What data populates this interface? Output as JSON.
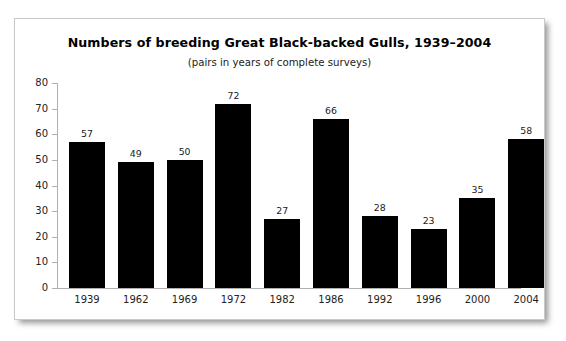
{
  "chart_data": {
    "type": "bar",
    "title": "Numbers of breeding Great Black-backed Gulls, 1939–2004",
    "subtitle": "(pairs in years of complete surveys)",
    "xlabel": "",
    "ylabel": "",
    "categories": [
      "1939",
      "1962",
      "1969",
      "1972",
      "1982",
      "1986",
      "1992",
      "1996",
      "2000",
      "2004"
    ],
    "values": [
      57,
      49,
      50,
      72,
      27,
      66,
      28,
      23,
      35,
      58
    ],
    "ylim": [
      0,
      80
    ],
    "yticks": [
      0,
      10,
      20,
      30,
      40,
      50,
      60,
      70,
      80
    ],
    "ytick_labels": [
      "0",
      "10",
      "20",
      "30",
      "40",
      "50",
      "60",
      "70",
      "80"
    ],
    "grid": false,
    "legend": false,
    "legend_position": "none",
    "bar_color": "#000000",
    "axis_color": "#b0b0b0",
    "text_color": "#222222",
    "background_color": "#ffffff",
    "border_color": "#c9c9c9",
    "data_labels_shown": true
  }
}
